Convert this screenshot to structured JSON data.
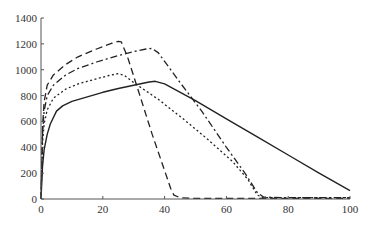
{
  "chart_data": {
    "type": "line",
    "title": "",
    "xlabel": "",
    "ylabel": "",
    "xlim": [
      0,
      100
    ],
    "ylim": [
      0,
      1400
    ],
    "x_ticks": [
      0,
      20,
      40,
      60,
      80,
      100
    ],
    "y_ticks": [
      0,
      200,
      400,
      600,
      800,
      1000,
      1200,
      1400
    ],
    "grid": false,
    "legend": null,
    "series": [
      {
        "name": "dashed",
        "style": "dashed",
        "points": [
          [
            0,
            0
          ],
          [
            0.5,
            550
          ],
          [
            1,
            750
          ],
          [
            2,
            880
          ],
          [
            4,
            960
          ],
          [
            8,
            1040
          ],
          [
            12,
            1100
          ],
          [
            18,
            1160
          ],
          [
            23,
            1205
          ],
          [
            25,
            1220
          ],
          [
            26,
            1215
          ],
          [
            28,
            1100
          ],
          [
            32,
            800
          ],
          [
            36,
            500
          ],
          [
            40,
            220
          ],
          [
            42,
            80
          ],
          [
            43,
            30
          ],
          [
            45,
            10
          ],
          [
            50,
            5
          ],
          [
            100,
            5
          ]
        ]
      },
      {
        "name": "dash-dot",
        "style": "dashdot",
        "points": [
          [
            0,
            0
          ],
          [
            0.5,
            500
          ],
          [
            1,
            680
          ],
          [
            2,
            800
          ],
          [
            4,
            880
          ],
          [
            8,
            960
          ],
          [
            12,
            1010
          ],
          [
            18,
            1060
          ],
          [
            25,
            1110
          ],
          [
            30,
            1140
          ],
          [
            34,
            1160
          ],
          [
            36,
            1165
          ],
          [
            38,
            1130
          ],
          [
            45,
            900
          ],
          [
            52,
            680
          ],
          [
            60,
            400
          ],
          [
            66,
            200
          ],
          [
            70,
            50
          ],
          [
            72,
            15
          ],
          [
            80,
            10
          ],
          [
            100,
            10
          ]
        ]
      },
      {
        "name": "dotted",
        "style": "dotted",
        "points": [
          [
            0,
            0
          ],
          [
            0.5,
            430
          ],
          [
            1,
            580
          ],
          [
            2,
            690
          ],
          [
            4,
            780
          ],
          [
            8,
            850
          ],
          [
            12,
            890
          ],
          [
            18,
            930
          ],
          [
            22,
            955
          ],
          [
            25,
            970
          ],
          [
            27,
            955
          ],
          [
            30,
            900
          ],
          [
            38,
            770
          ],
          [
            46,
            620
          ],
          [
            54,
            460
          ],
          [
            62,
            290
          ],
          [
            67,
            150
          ],
          [
            70,
            30
          ],
          [
            72,
            10
          ],
          [
            80,
            10
          ],
          [
            100,
            10
          ]
        ]
      },
      {
        "name": "solid",
        "style": "solid",
        "points": [
          [
            0,
            0
          ],
          [
            0.5,
            250
          ],
          [
            1,
            380
          ],
          [
            2,
            500
          ],
          [
            3,
            580
          ],
          [
            5,
            680
          ],
          [
            7,
            720
          ],
          [
            10,
            755
          ],
          [
            15,
            790
          ],
          [
            20,
            825
          ],
          [
            25,
            855
          ],
          [
            30,
            880
          ],
          [
            35,
            905
          ],
          [
            37,
            910
          ],
          [
            40,
            890
          ],
          [
            50,
            760
          ],
          [
            60,
            620
          ],
          [
            70,
            480
          ],
          [
            80,
            340
          ],
          [
            90,
            200
          ],
          [
            100,
            65
          ]
        ]
      }
    ]
  },
  "axes": {
    "x_tick_labels": [
      "0",
      "20",
      "40",
      "60",
      "80",
      "100"
    ],
    "y_tick_labels": [
      "0",
      "200",
      "400",
      "600",
      "800",
      "1000",
      "1200",
      "1400"
    ]
  }
}
